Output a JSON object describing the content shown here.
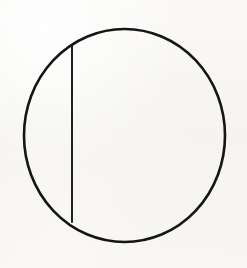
{
  "figure": {
    "kind": "geometric-line-drawing",
    "medium": "ink on paper",
    "description": "A hand-drawn circle divided by a single straight vertical chord near its left side",
    "background_color": "#f7f6f4",
    "ink_color": "#151515",
    "caption": ""
  },
  "canvas": {
    "width": 247,
    "height": 268
  },
  "shapes": {
    "circle": {
      "label": "circle outline",
      "center_x": 124.5,
      "center_y": 135.5,
      "radius_x": 100.5,
      "radius_y": 106.5,
      "stroke_width": 2.6,
      "stroke_color": "#151515",
      "fill": "none"
    },
    "chord": {
      "label": "vertical chord",
      "x1": 72,
      "y1": 46,
      "x2": 72,
      "y2": 222,
      "stroke_width": 1.9,
      "stroke_color": "#151515",
      "orientation": "vertical",
      "length": 176
    }
  },
  "regions": [
    {
      "name": "left-segment",
      "label": "minor circular segment left of chord"
    },
    {
      "name": "right-segment",
      "label": "major circular segment right of chord"
    }
  ],
  "chart_data": {
    "type": "scatter",
    "title": "",
    "xlabel": "",
    "ylabel": "",
    "xlim": [
      0,
      247
    ],
    "ylim": [
      268,
      0
    ],
    "grid": false,
    "legend": "none",
    "annotations": [
      {
        "text": "circle",
        "shape": "ellipse",
        "cx": 124.5,
        "cy": 135.5,
        "rx": 100.5,
        "ry": 106.5
      },
      {
        "text": "chord",
        "shape": "line",
        "x1": 72,
        "y1": 46,
        "x2": 72,
        "y2": 222
      }
    ]
  }
}
